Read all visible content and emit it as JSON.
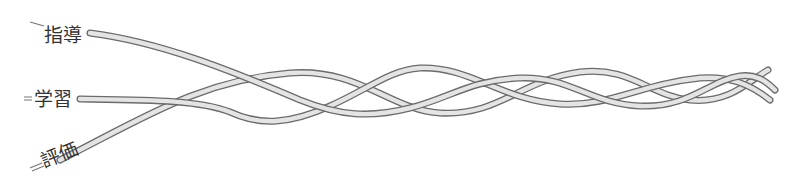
{
  "diagram": {
    "type": "braided-strands",
    "strands": [
      {
        "id": "shido",
        "label": "指導"
      },
      {
        "id": "gakushu",
        "label": "学習"
      },
      {
        "id": "hyoka",
        "label": "評価"
      }
    ],
    "colors": {
      "tube_outline": "#6b6b6b",
      "tube_fill": "#e4e4e4",
      "label": "#333333"
    }
  }
}
